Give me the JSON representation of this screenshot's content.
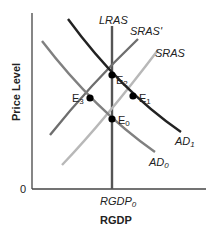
{
  "diagram": {
    "type": "AD-AS model",
    "y_axis_label": "Price Level",
    "x_axis_label": "RGDP",
    "origin_label": "0",
    "x_tick_label": "RGDP",
    "x_tick_subscript": "0",
    "curves": [
      {
        "name": "LRAS",
        "label": "LRAS",
        "color": "#555555"
      },
      {
        "name": "SRAS",
        "label": "SRAS",
        "color": "#b5b5b5"
      },
      {
        "name": "SRAS'",
        "label": "SRAS'",
        "color": "#6e6e6e"
      },
      {
        "name": "AD0",
        "label": "AD",
        "subscript": "0",
        "color": "#7a7a7a"
      },
      {
        "name": "AD1",
        "label": "AD",
        "subscript": "1",
        "color": "#222222"
      }
    ],
    "points": [
      {
        "label": "E",
        "subscript": "0"
      },
      {
        "label": "E",
        "subscript": "1"
      },
      {
        "label": "E",
        "subscript": "2"
      },
      {
        "label": "E",
        "subscript": "3"
      }
    ]
  }
}
